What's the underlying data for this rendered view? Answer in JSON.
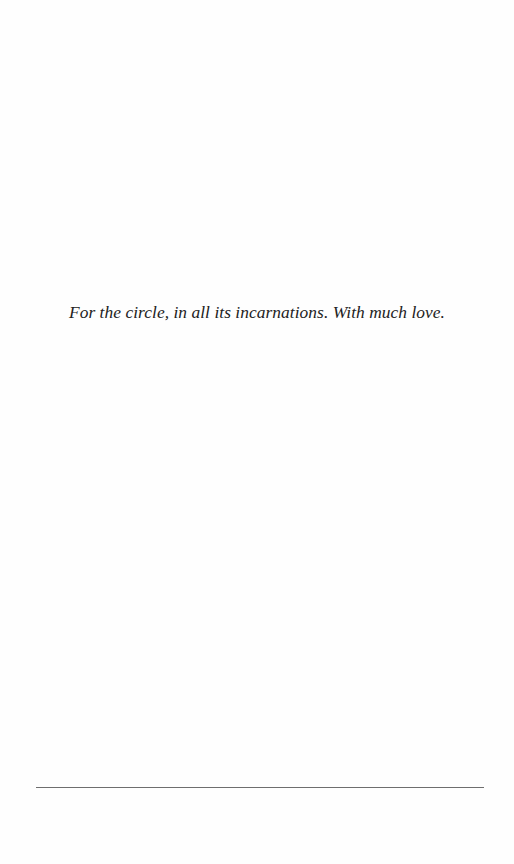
{
  "page": {
    "type": "dedication",
    "dedication_text": "For the circle, in all its incarnations. With much love."
  },
  "colors": {
    "background": "#fefefe",
    "text": "#222222",
    "rule": "#6e6e6e"
  }
}
